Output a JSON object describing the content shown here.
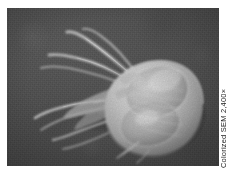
{
  "figure": {
    "kind": "scanning-electron-micrograph",
    "subject_label": "flagellated protozoan cell",
    "credit": "Colorized SEM 2,400×",
    "magnification": "2,400×",
    "imaging_technique": "SEM",
    "colorization": "Colorized",
    "background_color": "#4b4b4b",
    "specimen_color": "#d6d6d6",
    "plate_border_color": "#ffffff"
  },
  "plate": {
    "x": 7,
    "y": 8,
    "width": 212,
    "height": 158
  },
  "specimen": {
    "body_description": "pear-shaped cell body at right of frame",
    "flagella_count": 6,
    "flagella_direction": "upper-left and left",
    "adhesive_disc_description": "two large rounded lobes on ventral surface"
  }
}
